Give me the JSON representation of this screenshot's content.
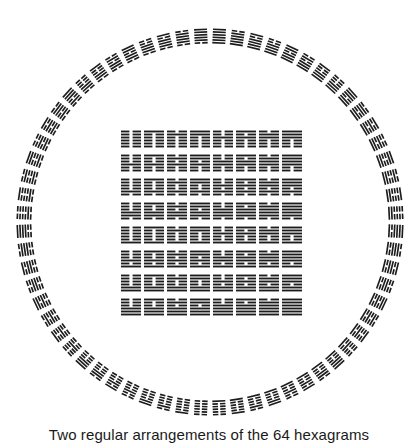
{
  "header_fragment": "",
  "caption": "Two regular arrangements of the 64 hexagrams",
  "colors": {
    "ink": "#1c1c1c",
    "background": "#ffffff"
  },
  "circle": {
    "name": "circular-arrangement",
    "center": [
      210,
      222
    ],
    "outer_radius": 194,
    "hexagram_height": 16,
    "hexagram_width": 13,
    "count": 64,
    "top_hexagram": "Qian (all yang)",
    "bottom_hexagram": "Kun (all yin)"
  },
  "square": {
    "name": "square-arrangement",
    "origin": [
      121,
      130
    ],
    "cell_width": 20,
    "cell_height": 18,
    "pitch_x": 23,
    "pitch_y": 24,
    "rows": 8,
    "cols": 8,
    "top_left": "Kun (all yin)",
    "top_right": "Pi (upper Qian, lower Kun)",
    "bottom_right": "Qian (all yang)",
    "trigram_order_binary": [
      0,
      1,
      2,
      3,
      4,
      5,
      6,
      7
    ]
  }
}
